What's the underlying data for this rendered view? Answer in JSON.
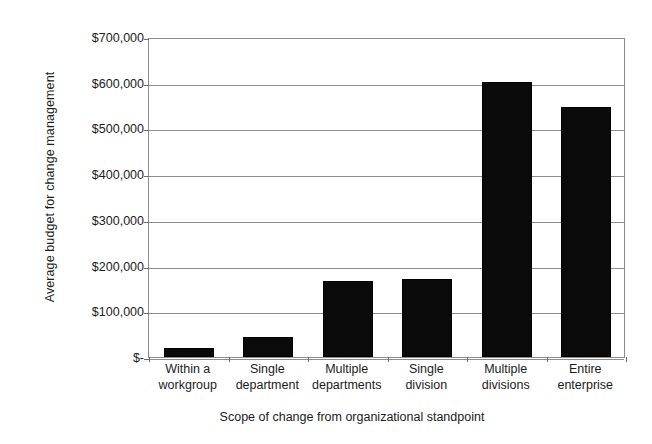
{
  "chart_data": {
    "type": "bar",
    "title": "",
    "xlabel": "Scope of change from organizational standpoint",
    "ylabel": "Average budget for change management",
    "categories": [
      "Within a workgroup",
      "Single department",
      "Multiple departments",
      "Single division",
      "Multiple divisions",
      "Entire enterprise"
    ],
    "category_lines": [
      [
        "Within a",
        "workgroup"
      ],
      [
        "Single",
        "department"
      ],
      [
        "Multiple",
        "departments"
      ],
      [
        "Single",
        "division"
      ],
      [
        "Multiple",
        "divisions"
      ],
      [
        "Entire",
        "enterprise"
      ]
    ],
    "values": [
      20000,
      44000,
      166000,
      171000,
      602000,
      547000
    ],
    "ylim": [
      0,
      700000
    ],
    "ytick_values": [
      0,
      100000,
      200000,
      300000,
      400000,
      500000,
      600000,
      700000
    ],
    "ytick_labels": [
      "$-",
      "$100,000",
      "$200,000",
      "$300,000",
      "$400,000",
      "$500,000",
      "$600,000",
      "$700,000"
    ],
    "grid": true,
    "legend": "none",
    "bar_color": "#0a0a0a",
    "gridline_color": "#8c8c8c",
    "background_color": "#ffffff"
  }
}
